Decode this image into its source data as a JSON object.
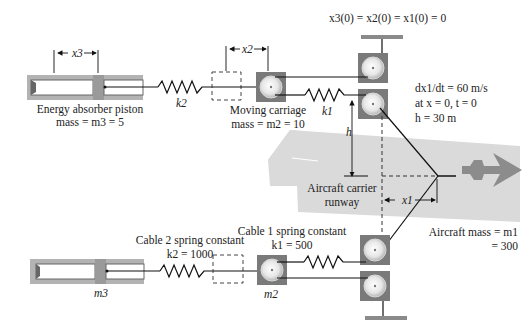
{
  "diagram": {
    "initial_condition": "x3(0) = x2(0) = x1(0) = 0",
    "conditions": {
      "velocity": "dx1/dt = 60 m/s",
      "at": "at x = 0, t = 0",
      "h": "h = 30 m"
    },
    "top": {
      "piston_label_line1": "Energy absorber piston",
      "piston_label_line2": "mass = m3 = 5",
      "spring_k2": "k2",
      "carriage_label_line1": "Moving carriage",
      "carriage_label_line2": "mass = m2 = 10",
      "spring_k1": "k1",
      "dim_x3": "x3",
      "dim_x2": "x2",
      "dim_h": "h"
    },
    "runway": {
      "label_line1": "Aircraft carrier",
      "label_line2": "runway",
      "dim_x1": "x1"
    },
    "aircraft": {
      "label_line1": "Aircraft mass = m1",
      "label_line2": "= 300"
    },
    "bottom": {
      "cable2_line1": "Cable 2 spring constant",
      "cable2_line2": "k2 = 1000",
      "cable1_line1": "Cable 1 spring constant",
      "cable1_line2": "k1 = 500",
      "piston_label": "m3",
      "carriage_label": "m2"
    },
    "colors": {
      "runway": "#d9d9d9",
      "aircraft": "#8a8a8a",
      "pulley_box": "#7a7a7a",
      "piston_body": "#b5b5b5",
      "line": "#111111"
    }
  }
}
